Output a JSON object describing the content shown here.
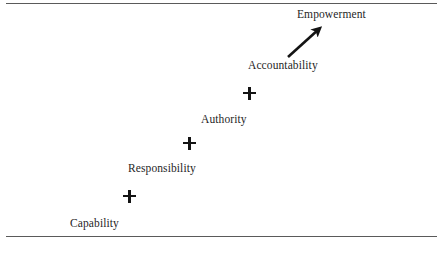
{
  "diagram": {
    "background_color": "#ffffff",
    "text_color": "#1f1f1f",
    "rule_color": "#5a5a5a",
    "marker_color": "#141414",
    "rules": {
      "top_label": "top-rule",
      "bottom_label": "bottom-rule"
    },
    "stages": [
      {
        "label": "Capability",
        "label_x": 70,
        "label_y": 218,
        "marker_x": 123,
        "marker_y": 190,
        "has_marker": true
      },
      {
        "label": "Responsibility",
        "label_x": 128,
        "label_y": 163,
        "marker_x": 183,
        "marker_y": 137,
        "has_marker": true
      },
      {
        "label": "Authority",
        "label_x": 201,
        "label_y": 114,
        "marker_x": 243,
        "marker_y": 87,
        "has_marker": true
      },
      {
        "label": "Accountability",
        "label_x": 248,
        "label_y": 60,
        "marker_x": 0,
        "marker_y": 0,
        "has_marker": false
      },
      {
        "label": "Empowerment",
        "label_x": 297,
        "label_y": 9,
        "marker_x": 0,
        "marker_y": 0,
        "has_marker": false
      }
    ],
    "arrow": {
      "name": "up-right-arrow",
      "from_x": 288,
      "from_y": 57,
      "to_x": 319,
      "to_y": 29
    }
  }
}
